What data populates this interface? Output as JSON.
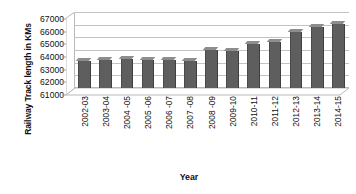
{
  "chart_data": {
    "type": "bar",
    "title": "",
    "xlabel": "Year",
    "ylabel": "Railway Track length in KMs",
    "ylim": [
      61000,
      67000
    ],
    "ytick_step": 1000,
    "yticks": [
      61000,
      62000,
      63000,
      64000,
      65000,
      66000,
      67000
    ],
    "ytick_labels": [
      "61000",
      "62000",
      "63000",
      "64000",
      "65000",
      "66000",
      "67000"
    ],
    "grid": true,
    "legend": "none",
    "style": "3d-column",
    "bar_color": "#5e5e5e",
    "bar_top_color": "#8d8d8d",
    "gridline_color": "#c3c3c3",
    "categories": [
      "2002-03",
      "2003-04",
      "2004 -05",
      "2005 -06",
      "2006 -07",
      "2007 -08",
      "2008 -09",
      "2009-10",
      "2010-11",
      "2011-12",
      "2012-13",
      "2013-14",
      "2014-15"
    ],
    "values": [
      63100,
      63200,
      63330,
      63230,
      63230,
      63150,
      63970,
      63890,
      64460,
      64600,
      65440,
      65810,
      66030
    ]
  }
}
